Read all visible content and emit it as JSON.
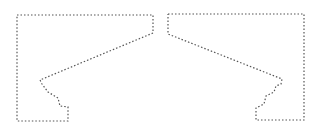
{
  "diagram": {
    "stroke_color": "#555555",
    "background": "#ffffff",
    "shapes": [
      {
        "name": "left-profile",
        "points": "17,15 153,15 153,33 40,80 42,84 48,92 58,98 60,106 68,107 68,121 17,121 17,15"
      },
      {
        "name": "right-profile",
        "points": "168,14 304,14 304,120 256,120 256,108 264,104 266,96 274,92 276,86 281,84 282,79 168,34 168,14"
      }
    ]
  }
}
